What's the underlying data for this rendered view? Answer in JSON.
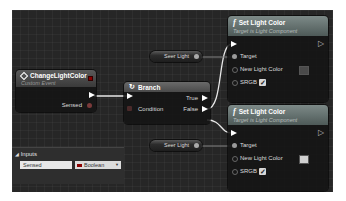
{
  "event_node": {
    "title": "ChangeLightColor",
    "subtitle": "Custom Event",
    "icon": "event-diamond-icon",
    "output_param": "Sensed"
  },
  "branch_node": {
    "title": "Branch",
    "icon": "branch-icon",
    "input_condition": "Condition",
    "output_true": "True",
    "output_false": "False"
  },
  "getters": [
    {
      "label": "Seer Light"
    },
    {
      "label": "Seer Light"
    }
  ],
  "set_nodes": [
    {
      "title": "Set Light Color",
      "subtitle": "Target is Light Component",
      "icon": "function-icon",
      "pins": {
        "target": "Target",
        "new_color": "New Light Color",
        "srgb": "SRGB"
      },
      "color_value": "#4a4a4a",
      "srgb_checked": true
    },
    {
      "title": "Set Light Color",
      "subtitle": "Target is Light Component",
      "icon": "function-icon",
      "pins": {
        "target": "Target",
        "new_color": "New Light Color",
        "srgb": "SRGB"
      },
      "color_value": "#d0d0d0",
      "srgb_checked": true
    }
  ],
  "inputs_panel": {
    "title": "Inputs",
    "param_name": "Sensed",
    "param_type": "Boolean",
    "type_color": "#8b0000"
  },
  "colors": {
    "canvas": "#262626",
    "event_header": "#4a4a4a",
    "function_header": "#5c6a68",
    "exec_wire": "#ffffff",
    "object_wire": "#7a7a7a"
  }
}
